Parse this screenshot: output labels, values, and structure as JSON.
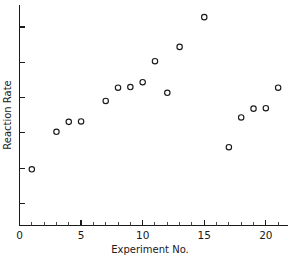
{
  "chart_data": {
    "type": "scatter",
    "title": "",
    "xlabel": "Experiment No.",
    "ylabel": "Reaction Rate",
    "xlim": [
      0,
      21.8
    ],
    "ylim": [
      0,
      10
    ],
    "grid": false,
    "legend": null,
    "x_ticks_major": [
      0,
      5,
      10,
      15,
      20
    ],
    "x_tick_labels": [
      "0",
      "5",
      "10",
      "15",
      "20"
    ],
    "x_ticks_minor": [
      1,
      2,
      3,
      4,
      6,
      7,
      8,
      9,
      11,
      12,
      13,
      14,
      16,
      17,
      18,
      19,
      21
    ],
    "y_ticks_major": [
      1.0,
      2.6,
      4.2,
      5.8,
      7.4,
      9.0
    ],
    "y_tick_labels": [
      "",
      "",
      "",
      "",
      "",
      ""
    ],
    "series": [
      {
        "name": "Reaction Rate",
        "marker": "open-circle",
        "color": "#1a1a1a",
        "x": [
          1,
          3,
          4,
          5,
          7,
          8,
          9,
          10,
          11,
          12,
          13,
          15,
          17,
          18,
          19,
          20,
          21
        ],
        "y": [
          2.55,
          4.25,
          4.7,
          4.72,
          5.65,
          6.25,
          6.28,
          6.5,
          7.45,
          6.02,
          8.1,
          9.45,
          3.55,
          4.9,
          5.3,
          5.32,
          6.25
        ]
      }
    ],
    "points": [
      {
        "label": "1",
        "x": 1,
        "y": 2.55
      },
      {
        "label": "3",
        "x": 3,
        "y": 4.25
      },
      {
        "label": "4",
        "x": 4,
        "y": 4.7
      },
      {
        "label": "5",
        "x": 5,
        "y": 4.72
      },
      {
        "label": "7",
        "x": 7,
        "y": 5.65
      },
      {
        "label": "8",
        "x": 8,
        "y": 6.25
      },
      {
        "label": "9",
        "x": 9,
        "y": 6.28
      },
      {
        "label": "10",
        "x": 10,
        "y": 6.5
      },
      {
        "label": "11",
        "x": 11,
        "y": 7.45
      },
      {
        "label": "12",
        "x": 12,
        "y": 6.02
      },
      {
        "label": "13",
        "x": 13,
        "y": 8.1
      },
      {
        "label": "15",
        "x": 15,
        "y": 9.45
      },
      {
        "label": "17",
        "x": 17,
        "y": 3.55
      },
      {
        "label": "18",
        "x": 18,
        "y": 4.9
      },
      {
        "label": "19",
        "x": 19,
        "y": 5.3
      },
      {
        "label": "20",
        "x": 20,
        "y": 5.32
      },
      {
        "label": "21",
        "x": 21,
        "y": 6.25
      }
    ]
  },
  "figure": {
    "background_color": "#ffffff",
    "axis_color": "#1a1a1a",
    "marker_color": "#1a1a1a"
  }
}
